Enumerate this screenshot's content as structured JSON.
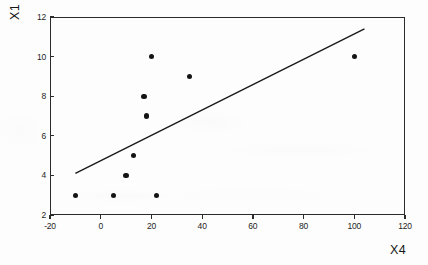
{
  "chart_data": {
    "type": "scatter",
    "title": "",
    "xlabel": "X4",
    "ylabel": "X1",
    "xlim": [
      -20,
      120
    ],
    "ylim": [
      2,
      12
    ],
    "xticks": [
      -20,
      0,
      20,
      40,
      60,
      80,
      100,
      120
    ],
    "yticks": [
      2,
      4,
      6,
      8,
      10,
      12
    ],
    "xtick_labels": [
      "-20",
      "0",
      "20",
      "40",
      "60",
      "80",
      "100",
      "120"
    ],
    "ytick_labels": [
      "2",
      "4",
      "6",
      "8",
      "10",
      "12"
    ],
    "grid": false,
    "legend": null,
    "marker": "filled-circle",
    "marker_color": "#141414",
    "line_color": "#1a1a1a",
    "frame_color": "#2b2b2b",
    "background_color": "#fdfdfd",
    "points": [
      {
        "x": -10,
        "y": 3
      },
      {
        "x": 5,
        "y": 3
      },
      {
        "x": 10,
        "y": 4
      },
      {
        "x": 13,
        "y": 5
      },
      {
        "x": 17,
        "y": 8
      },
      {
        "x": 18,
        "y": 7
      },
      {
        "x": 20,
        "y": 10
      },
      {
        "x": 22,
        "y": 3
      },
      {
        "x": 35,
        "y": 9
      },
      {
        "x": 100,
        "y": 10
      }
    ],
    "series": [
      {
        "name": "observations",
        "type": "scatter",
        "x": [
          -10,
          5,
          10,
          13,
          17,
          18,
          20,
          22,
          35,
          100
        ],
        "y": [
          3,
          3,
          4,
          5,
          8,
          7,
          10,
          3,
          9,
          10
        ]
      },
      {
        "name": "fit-line",
        "type": "line",
        "x": [
          -10,
          104
        ],
        "y": [
          4.1,
          11.4
        ]
      }
    ],
    "fit_line": {
      "x_start": -10,
      "y_start": 4.1,
      "x_end": 104,
      "y_end": 11.4
    }
  }
}
